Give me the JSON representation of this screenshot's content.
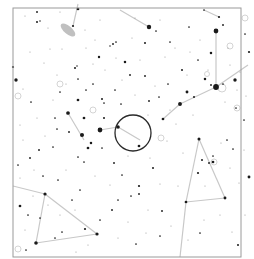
{
  "map": {
    "type": "star-chart",
    "width": 254,
    "height": 259,
    "frame": {
      "x": 13,
      "y": 8,
      "w": 228,
      "h": 249,
      "color": "#9a9a9a"
    },
    "colors": {
      "background": "#ffffff",
      "star": "#1a1a1a",
      "faint_star": "#9a9a9a",
      "constellation_line": "#c8c8c8",
      "target_circle": "#2a2a2a",
      "galaxy": "#c0c0c0",
      "deep_sky": "#d4d4d4"
    },
    "target_circle": {
      "cx": 133,
      "cy": 133,
      "r": 18
    },
    "galaxy": {
      "cx": 68,
      "cy": 30,
      "rx": 9,
      "ry": 4,
      "rotate": 40
    },
    "constellation_lines": [
      [
        [
          78,
          4
        ],
        [
          73,
          26
        ]
      ],
      [
        [
          120,
          10
        ],
        [
          149,
          27
        ]
      ],
      [
        [
          204,
          10
        ],
        [
          219,
          17
        ]
      ],
      [
        [
          216,
          31
        ],
        [
          216,
          87
        ]
      ],
      [
        [
          216,
          87
        ],
        [
          248,
          65
        ]
      ],
      [
        [
          216,
          87
        ],
        [
          180,
          104
        ]
      ],
      [
        [
          180,
          104
        ],
        [
          163,
          119
        ]
      ],
      [
        [
          68,
          113
        ],
        [
          84,
          140
        ]
      ],
      [
        [
          100,
          130
        ],
        [
          118,
          127
        ]
      ],
      [
        [
          118,
          127
        ],
        [
          140,
          140
        ]
      ],
      [
        [
          13,
          186
        ],
        [
          45,
          194
        ]
      ],
      [
        [
          45,
          194
        ],
        [
          97,
          234
        ]
      ],
      [
        [
          45,
          194
        ],
        [
          36,
          243
        ]
      ],
      [
        [
          36,
          243
        ],
        [
          97,
          234
        ]
      ],
      [
        [
          199,
          139
        ],
        [
          186,
          202
        ]
      ],
      [
        [
          199,
          139
        ],
        [
          225,
          198
        ]
      ],
      [
        [
          186,
          202
        ],
        [
          225,
          198
        ]
      ],
      [
        [
          186,
          202
        ],
        [
          180,
          257
        ]
      ]
    ],
    "stars": [
      {
        "x": 78,
        "y": 9,
        "m": 1.6
      },
      {
        "x": 37,
        "y": 12,
        "m": 1.1
      },
      {
        "x": 40,
        "y": 21,
        "m": 0.9
      },
      {
        "x": 37,
        "y": 22,
        "m": 1.2
      },
      {
        "x": 73,
        "y": 26,
        "m": 1.3
      },
      {
        "x": 149,
        "y": 27,
        "m": 2.6
      },
      {
        "x": 216,
        "y": 31,
        "m": 2.8
      },
      {
        "x": 204,
        "y": 10,
        "m": 1.0
      },
      {
        "x": 219,
        "y": 17,
        "m": 1.3
      },
      {
        "x": 223,
        "y": 25,
        "m": 1.1
      },
      {
        "x": 245,
        "y": 34,
        "m": 1.0
      },
      {
        "x": 13,
        "y": 67,
        "m": 1.3
      },
      {
        "x": 16,
        "y": 80,
        "m": 2.0
      },
      {
        "x": 99,
        "y": 57,
        "m": 1.4
      },
      {
        "x": 125,
        "y": 62,
        "m": 1.5
      },
      {
        "x": 145,
        "y": 43,
        "m": 1.2
      },
      {
        "x": 211,
        "y": 53,
        "m": 1.5
      },
      {
        "x": 249,
        "y": 52,
        "m": 1.3
      },
      {
        "x": 77,
        "y": 66,
        "m": 0.9
      },
      {
        "x": 75,
        "y": 68,
        "m": 1.2
      },
      {
        "x": 113,
        "y": 44,
        "m": 1.1
      },
      {
        "x": 116,
        "y": 42,
        "m": 1.0
      },
      {
        "x": 110,
        "y": 46,
        "m": 0.9
      },
      {
        "x": 216,
        "y": 87,
        "m": 3.4
      },
      {
        "x": 235,
        "y": 80,
        "m": 2.0
      },
      {
        "x": 205,
        "y": 79,
        "m": 1.5
      },
      {
        "x": 211,
        "y": 85,
        "m": 1.1
      },
      {
        "x": 223,
        "y": 84,
        "m": 1.0
      },
      {
        "x": 187,
        "y": 92,
        "m": 1.7
      },
      {
        "x": 194,
        "y": 97,
        "m": 1.2
      },
      {
        "x": 180,
        "y": 104,
        "m": 2.3
      },
      {
        "x": 163,
        "y": 119,
        "m": 1.6
      },
      {
        "x": 149,
        "y": 101,
        "m": 1.1
      },
      {
        "x": 182,
        "y": 70,
        "m": 1.2
      },
      {
        "x": 198,
        "y": 60,
        "m": 1.0
      },
      {
        "x": 189,
        "y": 27,
        "m": 1.0
      },
      {
        "x": 130,
        "y": 75,
        "m": 1.1
      },
      {
        "x": 145,
        "y": 76,
        "m": 1.1
      },
      {
        "x": 159,
        "y": 97,
        "m": 1.0
      },
      {
        "x": 78,
        "y": 100,
        "m": 1.6
      },
      {
        "x": 78,
        "y": 79,
        "m": 1.0
      },
      {
        "x": 86,
        "y": 90,
        "m": 1.0
      },
      {
        "x": 102,
        "y": 99,
        "m": 1.2
      },
      {
        "x": 104,
        "y": 103,
        "m": 1.0
      },
      {
        "x": 68,
        "y": 113,
        "m": 2.2
      },
      {
        "x": 84,
        "y": 118,
        "m": 1.6
      },
      {
        "x": 100,
        "y": 130,
        "m": 2.8
      },
      {
        "x": 82,
        "y": 135,
        "m": 2.4
      },
      {
        "x": 91,
        "y": 143,
        "m": 1.5
      },
      {
        "x": 118,
        "y": 127,
        "m": 2.1
      },
      {
        "x": 139,
        "y": 146,
        "m": 1.6
      },
      {
        "x": 104,
        "y": 118,
        "m": 1.2
      },
      {
        "x": 55,
        "y": 118,
        "m": 1.0
      },
      {
        "x": 57,
        "y": 129,
        "m": 1.0
      },
      {
        "x": 53,
        "y": 147,
        "m": 1.0
      },
      {
        "x": 39,
        "y": 150,
        "m": 1.1
      },
      {
        "x": 30,
        "y": 158,
        "m": 1.1
      },
      {
        "x": 88,
        "y": 148,
        "m": 1.6
      },
      {
        "x": 69,
        "y": 132,
        "m": 1.1
      },
      {
        "x": 43,
        "y": 176,
        "m": 1.0
      },
      {
        "x": 18,
        "y": 165,
        "m": 1.0
      },
      {
        "x": 114,
        "y": 163,
        "m": 1.1
      },
      {
        "x": 78,
        "y": 157,
        "m": 1.0
      },
      {
        "x": 102,
        "y": 148,
        "m": 1.0
      },
      {
        "x": 45,
        "y": 194,
        "m": 1.9
      },
      {
        "x": 20,
        "y": 206,
        "m": 1.6
      },
      {
        "x": 97,
        "y": 234,
        "m": 1.9
      },
      {
        "x": 36,
        "y": 243,
        "m": 2.1
      },
      {
        "x": 85,
        "y": 229,
        "m": 1.3
      },
      {
        "x": 55,
        "y": 238,
        "m": 1.0
      },
      {
        "x": 62,
        "y": 232,
        "m": 1.0
      },
      {
        "x": 72,
        "y": 200,
        "m": 1.0
      },
      {
        "x": 112,
        "y": 210,
        "m": 1.1
      },
      {
        "x": 84,
        "y": 162,
        "m": 1.0
      },
      {
        "x": 122,
        "y": 175,
        "m": 1.0
      },
      {
        "x": 118,
        "y": 200,
        "m": 1.0
      },
      {
        "x": 199,
        "y": 139,
        "m": 1.8
      },
      {
        "x": 202,
        "y": 160,
        "m": 1.2
      },
      {
        "x": 209,
        "y": 163,
        "m": 1.1
      },
      {
        "x": 213,
        "y": 162,
        "m": 1.6
      },
      {
        "x": 198,
        "y": 173,
        "m": 1.3
      },
      {
        "x": 213,
        "y": 156,
        "m": 1.0
      },
      {
        "x": 186,
        "y": 202,
        "m": 1.6
      },
      {
        "x": 225,
        "y": 198,
        "m": 1.7
      },
      {
        "x": 249,
        "y": 177,
        "m": 1.7
      },
      {
        "x": 139,
        "y": 186,
        "m": 1.3
      },
      {
        "x": 139,
        "y": 194,
        "m": 1.1
      },
      {
        "x": 153,
        "y": 168,
        "m": 1.2
      },
      {
        "x": 131,
        "y": 196,
        "m": 1.0
      },
      {
        "x": 162,
        "y": 211,
        "m": 1.1
      },
      {
        "x": 238,
        "y": 245,
        "m": 1.2
      },
      {
        "x": 200,
        "y": 233,
        "m": 1.0
      },
      {
        "x": 233,
        "y": 149,
        "m": 1.0
      },
      {
        "x": 227,
        "y": 140,
        "m": 1.0
      },
      {
        "x": 160,
        "y": 236,
        "m": 1.0
      },
      {
        "x": 136,
        "y": 244,
        "m": 1.0
      },
      {
        "x": 31,
        "y": 102,
        "m": 1.0
      },
      {
        "x": 60,
        "y": 92,
        "m": 1.0
      },
      {
        "x": 93,
        "y": 84,
        "m": 1.0
      },
      {
        "x": 115,
        "y": 90,
        "m": 1.0
      },
      {
        "x": 121,
        "y": 104,
        "m": 1.0
      },
      {
        "x": 244,
        "y": 120,
        "m": 1.0
      },
      {
        "x": 236,
        "y": 108,
        "m": 1.0
      },
      {
        "x": 168,
        "y": 84,
        "m": 1.0
      },
      {
        "x": 170,
        "y": 42,
        "m": 1.0
      },
      {
        "x": 156,
        "y": 31,
        "m": 1.0
      },
      {
        "x": 26,
        "y": 250,
        "m": 1.0
      },
      {
        "x": 58,
        "y": 180,
        "m": 1.0
      },
      {
        "x": 28,
        "y": 215,
        "m": 1.0
      },
      {
        "x": 40,
        "y": 218,
        "m": 1.0
      },
      {
        "x": 80,
        "y": 190,
        "m": 1.0
      },
      {
        "x": 100,
        "y": 220,
        "m": 1.0
      }
    ],
    "faint_stars": [
      {
        "x": 25,
        "y": 16
      },
      {
        "x": 48,
        "y": 28
      },
      {
        "x": 30,
        "y": 52
      },
      {
        "x": 50,
        "y": 49
      },
      {
        "x": 62,
        "y": 49
      },
      {
        "x": 86,
        "y": 48
      },
      {
        "x": 95,
        "y": 40
      },
      {
        "x": 116,
        "y": 58
      },
      {
        "x": 132,
        "y": 38
      },
      {
        "x": 165,
        "y": 57
      },
      {
        "x": 175,
        "y": 48
      },
      {
        "x": 190,
        "y": 52
      },
      {
        "x": 208,
        "y": 70
      },
      {
        "x": 230,
        "y": 65
      },
      {
        "x": 246,
        "y": 96
      },
      {
        "x": 240,
        "y": 72
      },
      {
        "x": 23,
        "y": 89
      },
      {
        "x": 44,
        "y": 63
      },
      {
        "x": 57,
        "y": 75
      },
      {
        "x": 66,
        "y": 84
      },
      {
        "x": 93,
        "y": 64
      },
      {
        "x": 140,
        "y": 60
      },
      {
        "x": 155,
        "y": 86
      },
      {
        "x": 170,
        "y": 110
      },
      {
        "x": 193,
        "y": 115
      },
      {
        "x": 225,
        "y": 102
      },
      {
        "x": 237,
        "y": 90
      },
      {
        "x": 176,
        "y": 124
      },
      {
        "x": 167,
        "y": 141
      },
      {
        "x": 183,
        "y": 153
      },
      {
        "x": 221,
        "y": 143
      },
      {
        "x": 244,
        "y": 150
      },
      {
        "x": 230,
        "y": 168
      },
      {
        "x": 239,
        "y": 183
      },
      {
        "x": 205,
        "y": 186
      },
      {
        "x": 178,
        "y": 186
      },
      {
        "x": 160,
        "y": 184
      },
      {
        "x": 148,
        "y": 210
      },
      {
        "x": 171,
        "y": 226
      },
      {
        "x": 204,
        "y": 220
      },
      {
        "x": 220,
        "y": 215
      },
      {
        "x": 245,
        "y": 215
      },
      {
        "x": 232,
        "y": 232
      },
      {
        "x": 188,
        "y": 240
      },
      {
        "x": 146,
        "y": 233
      },
      {
        "x": 128,
        "y": 222
      },
      {
        "x": 118,
        "y": 238
      },
      {
        "x": 76,
        "y": 252
      },
      {
        "x": 60,
        "y": 215
      },
      {
        "x": 48,
        "y": 205
      },
      {
        "x": 25,
        "y": 230
      },
      {
        "x": 20,
        "y": 178
      },
      {
        "x": 34,
        "y": 170
      },
      {
        "x": 66,
        "y": 170
      },
      {
        "x": 95,
        "y": 176
      },
      {
        "x": 75,
        "y": 210
      },
      {
        "x": 110,
        "y": 185
      },
      {
        "x": 128,
        "y": 156
      },
      {
        "x": 150,
        "y": 158
      },
      {
        "x": 23,
        "y": 140
      },
      {
        "x": 45,
        "y": 136
      },
      {
        "x": 37,
        "y": 118
      },
      {
        "x": 20,
        "y": 125
      },
      {
        "x": 105,
        "y": 70
      },
      {
        "x": 122,
        "y": 80
      },
      {
        "x": 135,
        "y": 95
      },
      {
        "x": 148,
        "y": 115
      },
      {
        "x": 187,
        "y": 75
      },
      {
        "x": 200,
        "y": 40
      },
      {
        "x": 228,
        "y": 48
      },
      {
        "x": 160,
        "y": 20
      },
      {
        "x": 135,
        "y": 18
      },
      {
        "x": 100,
        "y": 20
      },
      {
        "x": 60,
        "y": 12
      },
      {
        "x": 85,
        "y": 30
      },
      {
        "x": 53,
        "y": 100
      },
      {
        "x": 33,
        "y": 196
      },
      {
        "x": 88,
        "y": 245
      }
    ],
    "deep_sky_objects": [
      {
        "x": 60,
        "y": 84,
        "r": 3
      },
      {
        "x": 93,
        "y": 110,
        "r": 3
      },
      {
        "x": 18,
        "y": 96,
        "r": 3
      },
      {
        "x": 230,
        "y": 46,
        "r": 3
      },
      {
        "x": 245,
        "y": 18,
        "r": 3
      },
      {
        "x": 207,
        "y": 74,
        "r": 2.5
      },
      {
        "x": 237,
        "y": 108,
        "r": 3
      },
      {
        "x": 161,
        "y": 138,
        "r": 3
      },
      {
        "x": 214,
        "y": 162,
        "r": 3
      },
      {
        "x": 18,
        "y": 249,
        "r": 3
      },
      {
        "x": 222,
        "y": 88,
        "r": 4
      }
    ]
  }
}
